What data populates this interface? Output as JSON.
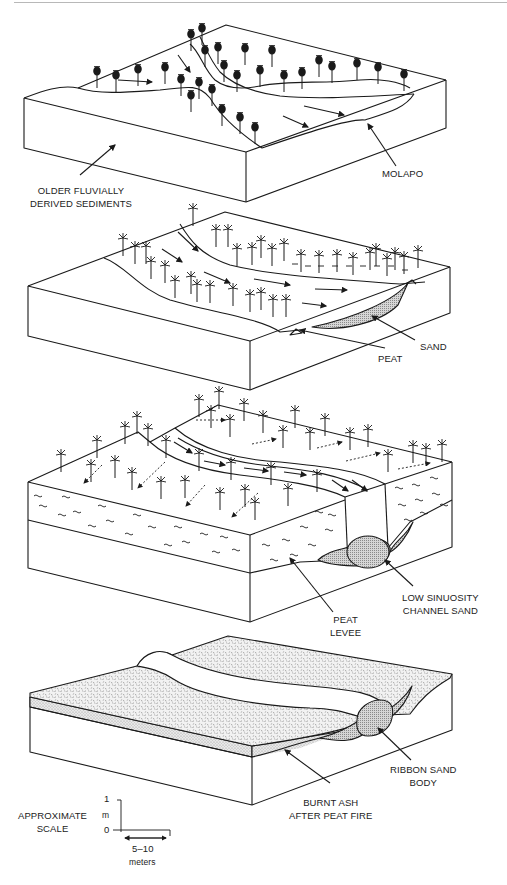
{
  "figure": {
    "panels": [
      {
        "id": "panel-1",
        "labels": {
          "older_sediments": [
            "OLDER FLUVIALLY",
            "DERIVED SEDIMENTS"
          ],
          "molapo": "MOLAPO"
        }
      },
      {
        "id": "panel-2",
        "labels": {
          "sand": "SAND",
          "peat": "PEAT"
        }
      },
      {
        "id": "panel-3",
        "labels": {
          "channel_sand": [
            "LOW SINUOSITY",
            "CHANNEL SAND"
          ],
          "peat_levee": [
            "PEAT",
            "LEVEE"
          ]
        }
      },
      {
        "id": "panel-4",
        "labels": {
          "ribbon_sand": [
            "RIBBON SAND",
            "BODY"
          ],
          "burnt_ash": [
            "BURNT ASH",
            "AFTER PEAT FIRE"
          ]
        }
      }
    ],
    "scale": {
      "title": [
        "APPROXIMATE",
        "SCALE"
      ],
      "vertical_top": "1",
      "vertical_unit": "m",
      "vertical_bottom": "0",
      "horizontal_value": "5–10",
      "horizontal_unit": "meters"
    },
    "colors": {
      "line": "#1a1a1a",
      "sand_fill": "#c8c8c8",
      "ash_fill": "#e6e6e6",
      "background": "#ffffff"
    }
  }
}
